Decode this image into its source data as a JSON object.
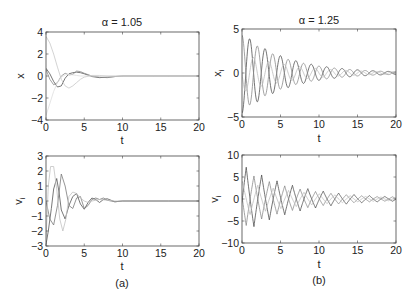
{
  "chart_data": [
    {
      "type": "line",
      "id": "a-top",
      "title": "α = 1.05",
      "xlabel": "t",
      "ylabel": "x",
      "ylabel_sub": "i",
      "xlim": [
        0,
        20
      ],
      "ylim": [
        -4,
        4
      ],
      "xticks": [
        0,
        5,
        10,
        15,
        20
      ],
      "yticks": [
        -4,
        -2,
        0,
        2,
        4
      ],
      "caption": "",
      "series": [
        {
          "name": "x1",
          "color": "#555555",
          "x": [
            0,
            0.5,
            1,
            1.5,
            2,
            2.5,
            3,
            3.5,
            4,
            4.5,
            5,
            6,
            7,
            8,
            9,
            10,
            12,
            14,
            16,
            18,
            20
          ],
          "y": [
            0.7,
            0.2,
            -0.5,
            -1.0,
            -0.9,
            -0.2,
            0.2,
            0.3,
            0.35,
            0.3,
            0.2,
            -0.05,
            -0.15,
            -0.1,
            -0.05,
            0,
            0,
            0,
            0,
            0,
            0
          ]
        },
        {
          "name": "x2",
          "color": "#8a8a8a",
          "x": [
            0,
            0.5,
            1,
            1.5,
            2,
            2.5,
            3,
            3.5,
            4,
            4.5,
            5,
            6,
            7,
            8,
            9,
            10,
            12,
            14,
            16,
            18,
            20
          ],
          "y": [
            0.6,
            -0.3,
            -0.8,
            -0.6,
            0.0,
            0.25,
            0.1,
            0.15,
            0.45,
            0.4,
            0.25,
            0.0,
            -0.1,
            -0.15,
            -0.05,
            0,
            0,
            0,
            0,
            0,
            0
          ]
        },
        {
          "name": "x3",
          "color": "#c8c8c8",
          "x": [
            0,
            0.5,
            1,
            1.5,
            2,
            2.5,
            3,
            3.5,
            4,
            4.5,
            5,
            6,
            7,
            8,
            9,
            10,
            12,
            14,
            16,
            18,
            20
          ],
          "y": [
            3.6,
            3.0,
            2.0,
            0.8,
            -0.3,
            -0.9,
            -1.1,
            -0.9,
            -0.6,
            -0.3,
            -0.1,
            0.05,
            0.05,
            0,
            0,
            0,
            0,
            0,
            0,
            0,
            0
          ]
        },
        {
          "name": "x4",
          "color": "#dedede",
          "x": [
            0,
            0.5,
            1,
            1.5,
            2,
            2.5,
            3,
            3.5,
            4,
            4.5,
            5,
            6,
            7,
            8,
            9,
            10,
            12,
            14,
            16,
            18,
            20
          ],
          "y": [
            -3.6,
            -2.5,
            -1.4,
            -0.6,
            -0.1,
            0.1,
            0.15,
            0.1,
            0.05,
            0,
            0,
            0,
            0,
            0,
            0,
            0,
            0,
            0,
            0,
            0,
            0
          ]
        }
      ]
    },
    {
      "type": "line",
      "id": "b-top",
      "title": "α = 1.25",
      "xlabel": "t",
      "ylabel": "x",
      "ylabel_sub": "i",
      "xlim": [
        0,
        20
      ],
      "ylim": [
        -5,
        5
      ],
      "xticks": [
        0,
        5,
        10,
        15,
        20
      ],
      "yticks": [
        -5,
        0,
        5
      ],
      "caption": "",
      "series": [
        {
          "name": "x1",
          "color": "#505050",
          "model": "damped",
          "amp": 4.6,
          "decay": 0.17,
          "omega": 3.14,
          "phase": 3.14,
          "floor": 0.18
        },
        {
          "name": "x2",
          "color": "#8c8c8c",
          "model": "damped",
          "amp": 4.3,
          "decay": 0.17,
          "omega": 3.14,
          "phase": 0.0,
          "floor": 0.18
        },
        {
          "name": "x3",
          "color": "#bdbdbd",
          "model": "damped",
          "amp": 2.2,
          "decay": 0.15,
          "omega": 3.14,
          "phase": 1.6,
          "floor": 0.15
        }
      ]
    },
    {
      "type": "line",
      "id": "a-bottom",
      "title": "",
      "xlabel": "t",
      "ylabel": "v",
      "ylabel_sub": "i",
      "xlim": [
        0,
        20
      ],
      "ylim": [
        -3,
        3
      ],
      "xticks": [
        0,
        5,
        10,
        15,
        20
      ],
      "yticks": [
        -3,
        -2,
        -1,
        0,
        1,
        2,
        3
      ],
      "caption": "(a)",
      "series": [
        {
          "name": "v1",
          "color": "#555555",
          "x": [
            0,
            0.3,
            0.7,
            1,
            1.4,
            1.7,
            2,
            2.5,
            3,
            3.5,
            4,
            4.5,
            5,
            5.5,
            6,
            6.5,
            7,
            7.5,
            8,
            9,
            10,
            11,
            12,
            14,
            16,
            20
          ],
          "y": [
            -2.9,
            -2.0,
            -0.5,
            0.8,
            1.5,
            0.6,
            -0.6,
            -1.2,
            -0.3,
            0.3,
            0.5,
            -0.2,
            -0.55,
            -0.1,
            0.2,
            0.1,
            -0.1,
            0.1,
            0.15,
            -0.05,
            0,
            0,
            0,
            0,
            0,
            0
          ]
        },
        {
          "name": "v2",
          "color": "#7a7a7a",
          "x": [
            0,
            0.5,
            1,
            1.5,
            2,
            2.5,
            3,
            3.5,
            4,
            4.5,
            5,
            5.5,
            6,
            6.5,
            7,
            7.5,
            8,
            9,
            10,
            11,
            12,
            14,
            16,
            20
          ],
          "y": [
            0,
            -1.2,
            -1.6,
            -0.3,
            1.8,
            1.0,
            -0.3,
            -0.5,
            0.2,
            0.3,
            -0.5,
            -0.3,
            0.1,
            0.2,
            0.1,
            0.2,
            0.05,
            -0.05,
            0,
            0,
            0,
            0,
            0,
            0
          ]
        },
        {
          "name": "v3",
          "color": "#c2c2c2",
          "x": [
            0,
            0.3,
            0.6,
            1,
            1.4,
            1.8,
            2.2,
            2.6,
            3,
            3.5,
            4,
            4.5,
            5,
            5.5,
            6,
            7,
            8,
            9,
            10,
            12,
            14,
            20
          ],
          "y": [
            -2.6,
            1.0,
            2.3,
            2.3,
            0.8,
            -1.2,
            -2.0,
            -1.2,
            0.3,
            0.6,
            0.5,
            0.2,
            0.0,
            -0.1,
            0.0,
            0.1,
            0.05,
            0,
            0,
            0,
            0,
            0
          ]
        }
      ]
    },
    {
      "type": "line",
      "id": "b-bottom",
      "title": "",
      "xlabel": "t",
      "ylabel": "v",
      "ylabel_sub": "i",
      "xlim": [
        0,
        20
      ],
      "ylim": [
        -10,
        10
      ],
      "xticks": [
        0,
        5,
        10,
        15,
        20
      ],
      "yticks": [
        -10,
        -5,
        0,
        5,
        10
      ],
      "caption": "(b)",
      "series": [
        {
          "name": "v1",
          "color": "#505050",
          "model": "zigzag",
          "amp": 7.8,
          "decay": 0.14,
          "period": 2.0,
          "phase": 0.45,
          "floor": 0.5
        },
        {
          "name": "v2",
          "color": "#8a8a8a",
          "model": "zigzag",
          "amp": 6.5,
          "decay": 0.14,
          "period": 2.0,
          "phase": 1.45,
          "floor": 0.5
        },
        {
          "name": "v3",
          "color": "#bdbdbd",
          "model": "zigzag",
          "amp": 4.0,
          "decay": 0.12,
          "period": 2.0,
          "phase": 0.95,
          "floor": 0.4
        }
      ]
    }
  ]
}
